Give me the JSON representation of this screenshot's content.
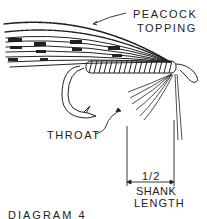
{
  "diagram": {
    "title": "DIAGRAM 4",
    "labels": {
      "peacock_line1": "PEACOCK",
      "peacock_line2": "TOPPING",
      "throat": "THROAT",
      "fraction": "1/2",
      "shank": "SHANK",
      "length": "LENGTH"
    },
    "colors": {
      "ink": "#222222",
      "background": "#ffffff"
    }
  }
}
